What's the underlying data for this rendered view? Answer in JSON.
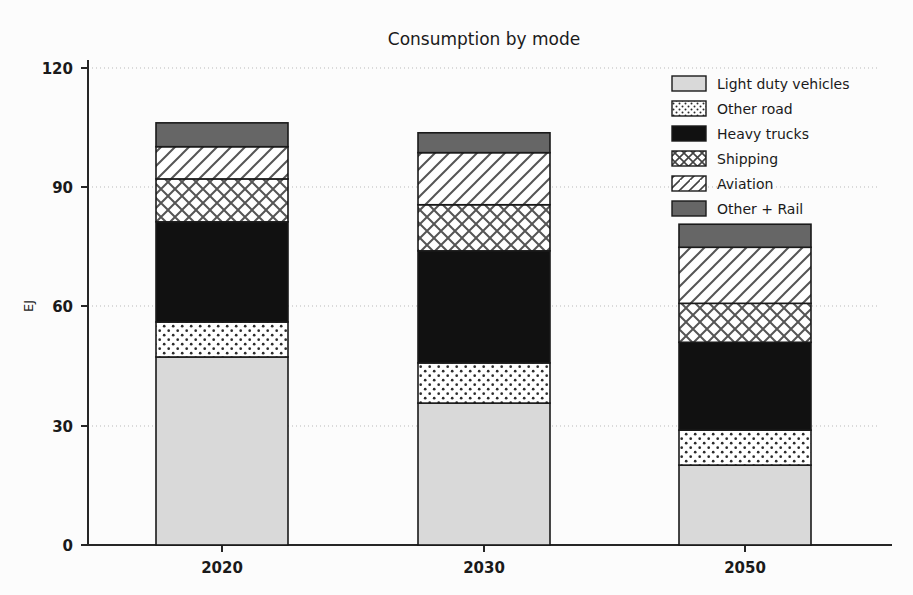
{
  "chart_data": {
    "type": "bar",
    "subtype": "stacked-bar",
    "title": "Consumption by mode",
    "xlabel": "",
    "ylabel": "EJ",
    "categories": [
      "2020",
      "2030",
      "2050"
    ],
    "ylim": [
      0,
      120
    ],
    "yticks": [
      0,
      30,
      60,
      90,
      120
    ],
    "ytick_labels": [
      "0",
      "30",
      "60",
      "90",
      "120"
    ],
    "grid": "y-axis dotted gridlines",
    "legend_position": "upper right",
    "series": [
      {
        "name": "Light duty vehicles",
        "pattern": "solid-light-gray",
        "color": "#d9d9d9",
        "values": [
          47.3,
          35.7,
          20.1
        ]
      },
      {
        "name": "Other road",
        "pattern": "dots",
        "color": "#ffffff",
        "values": [
          8.8,
          10.1,
          8.8
        ]
      },
      {
        "name": "Heavy trucks",
        "pattern": "solid-black",
        "color": "#111111",
        "values": [
          25.2,
          28.2,
          22.1
        ]
      },
      {
        "name": "Shipping",
        "pattern": "crosshatch",
        "color": "#ffffff",
        "values": [
          10.8,
          11.6,
          9.8
        ]
      },
      {
        "name": "Aviation",
        "pattern": "diagonal-hatch",
        "color": "#ffffff",
        "values": [
          8.1,
          13.1,
          14.1
        ]
      },
      {
        "name": "Other + Rail",
        "pattern": "solid-dark-gray",
        "color": "#666666",
        "values": [
          6.0,
          5.0,
          5.8
        ]
      }
    ],
    "totals": [
      106.2,
      103.7,
      80.7
    ]
  },
  "legend": {
    "items": [
      {
        "label": "Light duty vehicles"
      },
      {
        "label": "Other road"
      },
      {
        "label": "Heavy trucks"
      },
      {
        "label": "Shipping"
      },
      {
        "label": "Aviation"
      },
      {
        "label": "Other + Rail"
      }
    ]
  },
  "axes": {
    "y_title": "EJ",
    "y_ticks": [
      "120",
      "90",
      "60",
      "30",
      "0"
    ],
    "x_ticks": [
      "2020",
      "2030",
      "2050"
    ]
  },
  "title": {
    "text": "Consumption by mode"
  }
}
